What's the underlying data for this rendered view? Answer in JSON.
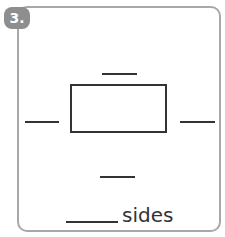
{
  "exercise": {
    "number": "3.",
    "shape": "rectangle",
    "answer_suffix": "sides",
    "colors": {
      "badge": "#8e8e8e",
      "border": "#a8a8a8",
      "ink": "#333333"
    }
  }
}
